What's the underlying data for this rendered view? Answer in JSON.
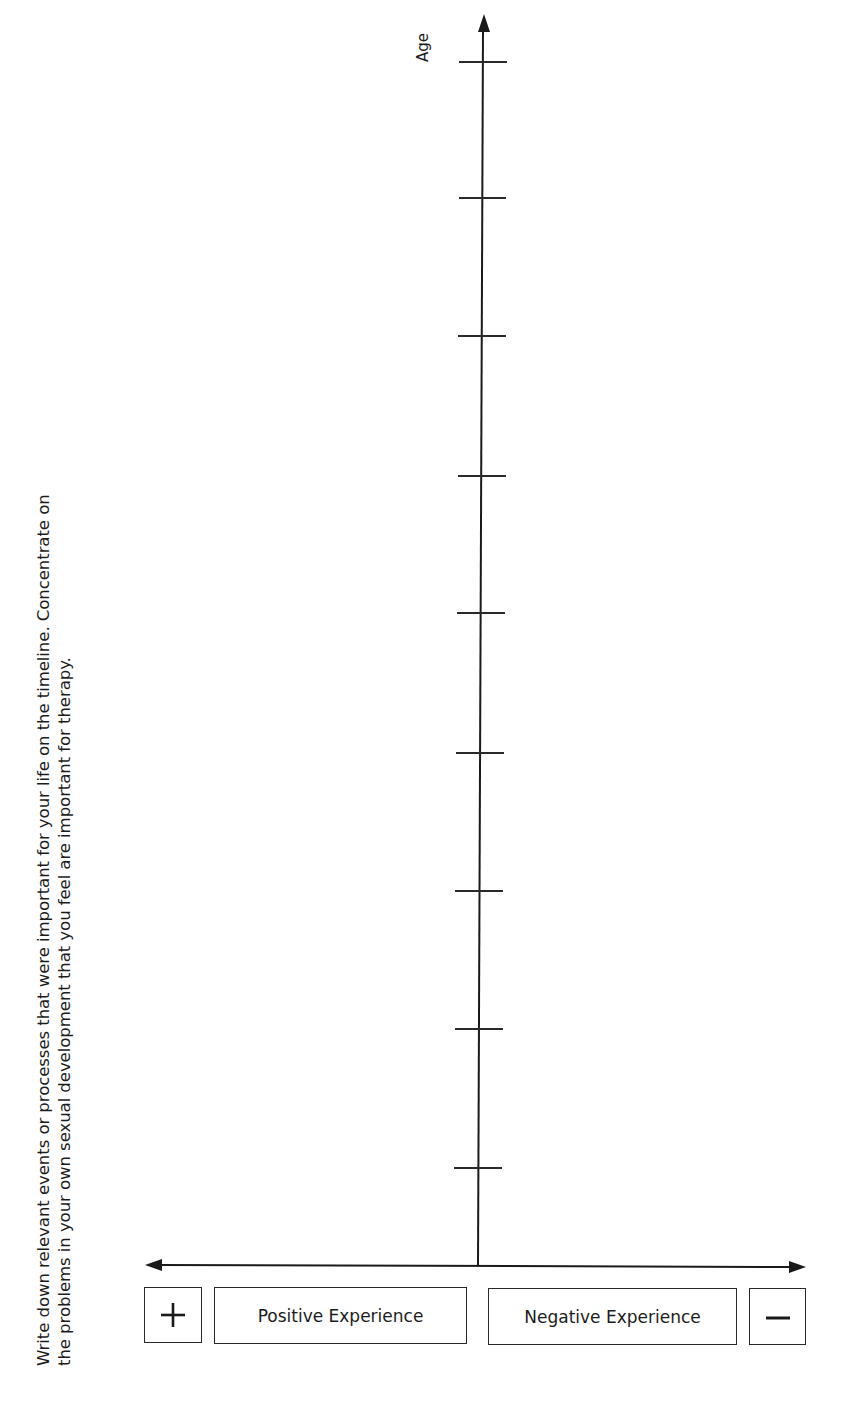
{
  "instructions": {
    "line1": "Write down relevant events or processes that were important for your life on the timeline. Concentrate on",
    "line2": "the problems in your own sexual development that you feel are important for therapy."
  },
  "timeline": {
    "vertical_axis_label": "Age",
    "tick_count": 9,
    "horizontal_axis": "bidirectional arrow"
  },
  "legend": {
    "plus_symbol": "+",
    "positive_label": "Positive Experience",
    "negative_label": "Negative Experience",
    "minus_symbol": "−"
  }
}
